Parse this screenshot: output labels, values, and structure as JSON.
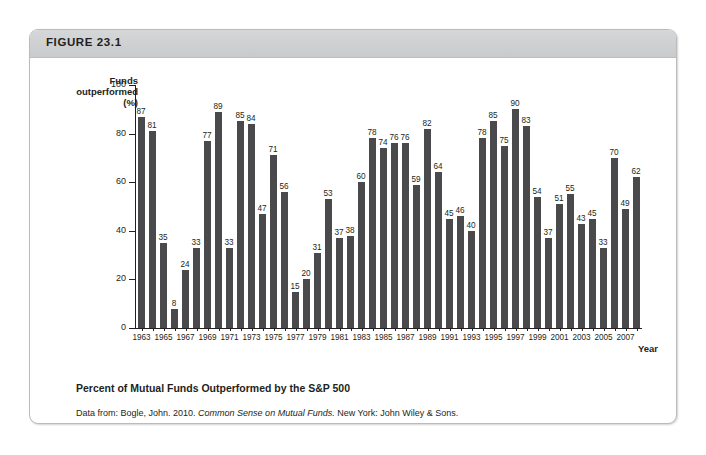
{
  "figure": {
    "header_label": "FIGURE 23.1",
    "caption": "Percent of Mutual Funds Outperformed by the S&P 500",
    "source_prefix": "Data from: Bogle, John. 2010.",
    "source_italic": "Common Sense on Mutual Funds.",
    "source_suffix": "New York: John Wiley & Sons."
  },
  "chart_data": {
    "type": "bar",
    "title": "Percent of Mutual Funds Outperformed by the S&P 500",
    "xlabel": "Year",
    "ylabel": "Funds outperformed (%)",
    "ylabel_line1": "Funds",
    "ylabel_line2": "outperformed (%)",
    "ylim": [
      0,
      100
    ],
    "yticks": [
      0,
      20,
      40,
      60,
      80,
      100
    ],
    "grid": false,
    "legend": null,
    "bar_color": "#4a4a4c",
    "xtick_step": 2,
    "xtick_labels": [
      "1963",
      "1965",
      "1967",
      "1969",
      "1971",
      "1973",
      "1975",
      "1977",
      "1979",
      "1981",
      "1983",
      "1985",
      "1987",
      "1989",
      "1991",
      "1993",
      "1995",
      "1997",
      "1999",
      "2001",
      "2003",
      "2005",
      "2007"
    ],
    "categories": [
      "1963",
      "1964",
      "1965",
      "1966",
      "1967",
      "1968",
      "1969",
      "1970",
      "1971",
      "1972",
      "1973",
      "1974",
      "1975",
      "1976",
      "1977",
      "1978",
      "1979",
      "1980",
      "1981",
      "1982",
      "1983",
      "1984",
      "1985",
      "1986",
      "1987",
      "1988",
      "1989",
      "1990",
      "1991",
      "1992",
      "1993",
      "1994",
      "1995",
      "1996",
      "1997",
      "1998",
      "1999",
      "2000",
      "2001",
      "2002",
      "2003",
      "2004",
      "2005",
      "2006",
      "2007",
      "2008"
    ],
    "values": [
      87,
      81,
      35,
      8,
      24,
      33,
      77,
      89,
      33,
      85,
      84,
      47,
      71,
      56,
      15,
      20,
      31,
      53,
      37,
      38,
      60,
      78,
      74,
      76,
      76,
      59,
      82,
      64,
      45,
      46,
      40,
      78,
      85,
      75,
      90,
      83,
      54,
      37,
      51,
      55,
      43,
      45,
      33,
      70,
      49,
      62
    ]
  }
}
